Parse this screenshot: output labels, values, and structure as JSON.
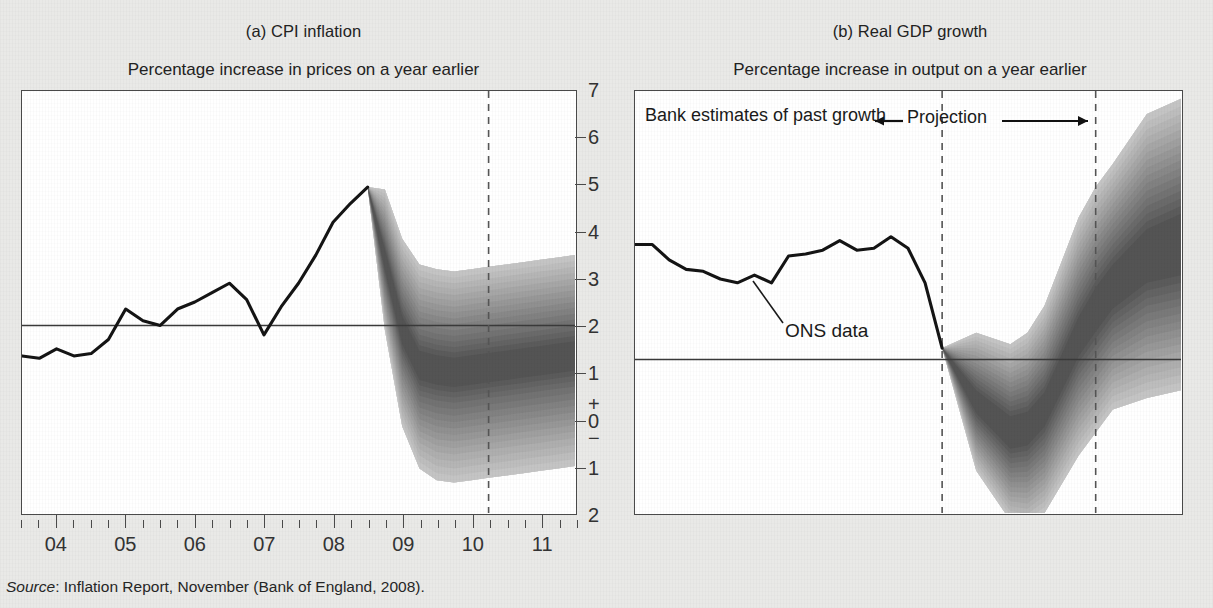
{
  "figure": {
    "cut_title_fragment": "projections",
    "source_prefix": "Source",
    "source_text": ": Inflation Report, November (Bank of England, 2008)."
  },
  "panels": [
    {
      "id": "a",
      "title": "(a) CPI inflation",
      "subtitle": "Percentage increase in prices on a year earlier",
      "annotations": []
    },
    {
      "id": "b",
      "title": "(b) Real GDP growth",
      "subtitle": "Percentage increase in output on a year earlier",
      "annotations": [
        {
          "name": "bank-estimates-label",
          "text": "Bank estimates of past growth"
        },
        {
          "name": "projection-label",
          "text": "Projection"
        },
        {
          "name": "ons-data-label",
          "text": "ONS data"
        }
      ]
    }
  ],
  "axis_labels": {
    "x": [
      "04",
      "05",
      "06",
      "07",
      "08",
      "09",
      "10",
      "11"
    ],
    "y_cpi": [
      "7",
      "6",
      "5",
      "4",
      "3",
      "2",
      "1",
      "+",
      "0",
      "−",
      "1",
      "2"
    ],
    "y_gdp": [
      "7",
      "6",
      "5",
      "4",
      "3",
      "2",
      "1",
      "+",
      "0",
      "−",
      "1",
      "2",
      "3",
      "4"
    ]
  },
  "colors": {
    "background": "#e9e9e7",
    "plot_background": "#ffffff",
    "axis": "#4a4a4a",
    "data_line": "#141414",
    "fan_dark": "#4a4a4a",
    "fan_light": "#d8d8d8",
    "reference_line": "#3a3a3a",
    "dashed_marker": "#555555",
    "text": "#1c1c1c"
  },
  "chart_data": [
    {
      "type": "area",
      "name": "cpi-inflation-fan-chart",
      "title": "(a) CPI inflation",
      "ylabel": "Percentage increase in prices on a year earlier",
      "xlabel": "",
      "ylim": [
        -2,
        7
      ],
      "xlim": [
        2003.5,
        2011.5
      ],
      "yticks": [
        -2,
        -1,
        0,
        1,
        2,
        3,
        4,
        5,
        6,
        7
      ],
      "xticks": [
        2004,
        2005,
        2006,
        2007,
        2008,
        2009,
        2010,
        2011
      ],
      "grid": false,
      "legend": "none",
      "reference_line": {
        "y": 2,
        "label": "inflation target"
      },
      "vertical_markers": [
        2010.25
      ],
      "series": [
        {
          "name": "CPI inflation (outturn)",
          "x": [
            2003.5,
            2003.75,
            2004.0,
            2004.25,
            2004.5,
            2004.75,
            2005.0,
            2005.25,
            2005.5,
            2005.75,
            2006.0,
            2006.25,
            2006.5,
            2006.75,
            2007.0,
            2007.25,
            2007.5,
            2007.75,
            2008.0,
            2008.25,
            2008.5
          ],
          "values": [
            1.35,
            1.3,
            1.5,
            1.35,
            1.4,
            1.7,
            2.35,
            2.1,
            2.0,
            2.35,
            2.5,
            2.7,
            2.9,
            2.55,
            1.8,
            2.4,
            2.9,
            3.5,
            4.2,
            4.6,
            4.95
          ]
        },
        {
          "name": "fan central projection",
          "x": [
            2008.5,
            2008.75,
            2009.0,
            2009.25,
            2009.5,
            2009.75,
            2010.0,
            2010.25,
            2010.5,
            2010.75,
            2011.0,
            2011.25,
            2011.5
          ],
          "values": [
            4.95,
            3.4,
            1.9,
            1.15,
            1.05,
            1.0,
            1.05,
            1.1,
            1.15,
            1.2,
            1.25,
            1.3,
            1.35
          ]
        }
      ],
      "fan_bands": [
        {
          "probability": 10,
          "lower": [
            4.95,
            3.25,
            1.7,
            0.95,
            0.85,
            0.8,
            0.85,
            0.9,
            0.95,
            1.0,
            1.05,
            1.1,
            1.15
          ],
          "upper": [
            4.95,
            3.55,
            2.1,
            1.35,
            1.25,
            1.2,
            1.25,
            1.3,
            1.35,
            1.4,
            1.45,
            1.5,
            1.55
          ]
        },
        {
          "probability": 30,
          "lower": [
            4.95,
            2.95,
            1.3,
            0.5,
            0.4,
            0.35,
            0.4,
            0.45,
            0.5,
            0.55,
            0.6,
            0.65,
            0.7
          ],
          "upper": [
            4.95,
            3.85,
            2.5,
            1.8,
            1.7,
            1.65,
            1.7,
            1.75,
            1.8,
            1.85,
            1.9,
            1.95,
            2.0
          ]
        },
        {
          "probability": 50,
          "lower": [
            4.95,
            2.6,
            0.85,
            0.0,
            -0.15,
            -0.2,
            -0.15,
            -0.1,
            -0.05,
            0.0,
            0.05,
            0.1,
            0.15
          ],
          "upper": [
            4.95,
            4.2,
            2.95,
            2.3,
            2.2,
            2.15,
            2.2,
            2.25,
            2.3,
            2.35,
            2.4,
            2.45,
            2.5
          ]
        },
        {
          "probability": 70,
          "lower": [
            4.95,
            2.25,
            0.35,
            -0.5,
            -0.7,
            -0.75,
            -0.7,
            -0.65,
            -0.6,
            -0.55,
            -0.5,
            -0.45,
            -0.4
          ],
          "upper": [
            4.95,
            4.55,
            3.4,
            2.8,
            2.7,
            2.65,
            2.7,
            2.75,
            2.8,
            2.85,
            2.9,
            2.95,
            3.0
          ]
        },
        {
          "probability": 90,
          "lower": [
            4.95,
            1.9,
            -0.15,
            -1.05,
            -1.3,
            -1.35,
            -1.3,
            -1.25,
            -1.2,
            -1.15,
            -1.1,
            -1.05,
            -1.0
          ],
          "upper": [
            4.95,
            4.9,
            3.85,
            3.3,
            3.2,
            3.15,
            3.2,
            3.25,
            3.3,
            3.35,
            3.4,
            3.45,
            3.5
          ]
        }
      ]
    },
    {
      "type": "area",
      "name": "real-gdp-growth-fan-chart",
      "title": "(b) Real GDP growth",
      "ylabel": "Percentage increase in output on a year earlier",
      "xlabel": "",
      "ylim": [
        -4,
        7
      ],
      "xlim": [
        2003.5,
        2011.5
      ],
      "yticks": [
        -4,
        -3,
        -2,
        -1,
        0,
        1,
        2,
        3,
        4,
        5,
        6,
        7
      ],
      "xticks": [
        2004,
        2005,
        2006,
        2007,
        2008,
        2009,
        2010,
        2011
      ],
      "grid": false,
      "legend": "none",
      "reference_line": {
        "y": 0,
        "label": "zero growth"
      },
      "vertical_markers": [
        2008.0,
        2010.25
      ],
      "series": [
        {
          "name": "ONS data (past growth)",
          "x": [
            2003.5,
            2003.75,
            2004.0,
            2004.25,
            2004.5,
            2004.75,
            2005.0,
            2005.25,
            2005.5,
            2005.75,
            2006.0,
            2006.25,
            2006.5,
            2006.75,
            2007.0,
            2007.25,
            2007.5,
            2007.75,
            2008.0
          ],
          "values": [
            3.0,
            3.0,
            2.6,
            2.35,
            2.3,
            2.1,
            2.0,
            2.2,
            2.0,
            2.7,
            2.75,
            2.85,
            3.1,
            2.85,
            2.9,
            3.2,
            2.9,
            2.0,
            0.3
          ]
        },
        {
          "name": "fan central projection",
          "x": [
            2008.0,
            2008.5,
            2009.0,
            2009.25,
            2009.5,
            2010.0,
            2010.25,
            2010.5,
            2011.0,
            2011.5
          ],
          "values": [
            0.3,
            -1.1,
            -1.9,
            -1.8,
            -1.3,
            0.6,
            1.3,
            1.9,
            2.7,
            3.0
          ]
        }
      ],
      "fan_bands": [
        {
          "probability": 10,
          "lower": [
            0.3,
            -1.3,
            -2.2,
            -2.1,
            -1.6,
            0.25,
            0.9,
            1.5,
            2.2,
            2.4
          ],
          "upper": [
            0.3,
            -0.9,
            -1.6,
            -1.5,
            -1.0,
            0.95,
            1.7,
            2.3,
            3.2,
            3.6
          ]
        },
        {
          "probability": 30,
          "lower": [
            0.3,
            -1.7,
            -2.7,
            -2.65,
            -2.2,
            -0.4,
            0.2,
            0.8,
            1.4,
            1.6
          ],
          "upper": [
            0.3,
            -0.5,
            -1.1,
            -0.95,
            -0.4,
            1.6,
            2.4,
            3.0,
            4.0,
            4.4
          ]
        },
        {
          "probability": 50,
          "lower": [
            0.3,
            -2.1,
            -3.2,
            -3.2,
            -2.8,
            -1.1,
            -0.5,
            0.1,
            0.6,
            0.8
          ],
          "upper": [
            0.3,
            -0.1,
            -0.6,
            -0.4,
            0.2,
            2.3,
            3.1,
            3.7,
            4.8,
            5.2
          ]
        },
        {
          "probability": 70,
          "lower": [
            0.3,
            -2.5,
            -3.7,
            -3.75,
            -3.4,
            -1.8,
            -1.2,
            -0.6,
            -0.2,
            0.0
          ],
          "upper": [
            0.3,
            0.3,
            -0.1,
            0.15,
            0.8,
            3.0,
            3.8,
            4.4,
            5.6,
            6.0
          ]
        },
        {
          "probability": 90,
          "lower": [
            0.3,
            -2.9,
            -4.2,
            -4.3,
            -4.0,
            -2.5,
            -1.9,
            -1.3,
            -1.0,
            -0.8
          ],
          "upper": [
            0.3,
            0.7,
            0.4,
            0.7,
            1.4,
            3.7,
            4.5,
            5.1,
            6.4,
            6.8
          ]
        }
      ]
    }
  ]
}
